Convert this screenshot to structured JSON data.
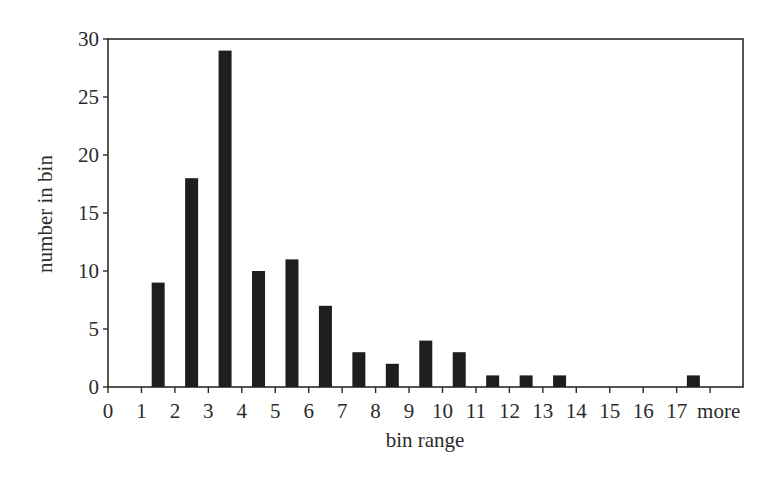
{
  "chart_data": {
    "type": "bar",
    "title": "",
    "xlabel": "bin range",
    "ylabel": "number in bin",
    "ylim": [
      0,
      30
    ],
    "yticks": [
      0,
      5,
      10,
      15,
      20,
      25,
      30
    ],
    "xticks": [
      "0",
      "1",
      "2",
      "3",
      "4",
      "5",
      "6",
      "7",
      "8",
      "9",
      "10",
      "11",
      "12",
      "13",
      "14",
      "15",
      "16",
      "17",
      "more"
    ],
    "categories": [
      "0-1",
      "1-2",
      "2-3",
      "3-4",
      "4-5",
      "5-6",
      "6-7",
      "7-8",
      "8-9",
      "9-10",
      "10-11",
      "11-12",
      "12-13",
      "13-14",
      "14-15",
      "15-16",
      "16-17",
      "17-more"
    ],
    "values": [
      0,
      9,
      18,
      29,
      10,
      11,
      7,
      3,
      2,
      4,
      3,
      1,
      1,
      1,
      0,
      0,
      0,
      1
    ],
    "grid": false,
    "legend": null,
    "bar_color": "#1e1e1e",
    "axis_color": "#2a2a2a"
  }
}
